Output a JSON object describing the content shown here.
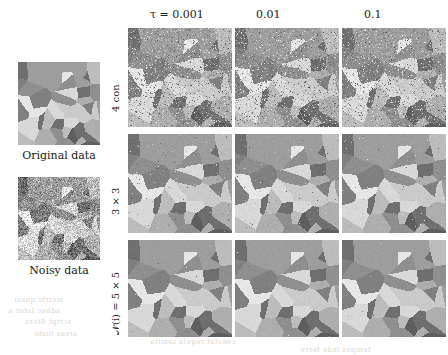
{
  "figure": {
    "type": "image-grid"
  },
  "columns": [
    {
      "id": "tau-0.001",
      "label": "τ = 0.001",
      "tau": 0.001
    },
    {
      "id": "tau-0.01",
      "label": "0.01",
      "tau": 0.01
    },
    {
      "id": "tau-0.1",
      "label": "0.1",
      "tau": 0.1
    }
  ],
  "rows": [
    {
      "id": "row-4con",
      "label": "4 con",
      "neighborhood": "4-connectivity"
    },
    {
      "id": "row-3x3",
      "label": "3 × 3",
      "neighborhood": "3x3"
    },
    {
      "id": "row-5x5",
      "label": "𝒩(i) = 5 × 5",
      "neighborhood": "5x5"
    }
  ],
  "reference_panels": [
    {
      "id": "original-data",
      "caption": "Original data"
    },
    {
      "id": "noisy-data",
      "caption": "Noisy data"
    }
  ],
  "palette": {
    "levels": [
      "#5e5e5e",
      "#6f6f6f",
      "#808080",
      "#8f8f8f",
      "#9d9d9d",
      "#aeaeae",
      "#bcbcbc",
      "#cacaca",
      "#d8d8d8",
      "#e6e6e6"
    ],
    "background": "#ffffff",
    "text": "#1a1a1a"
  },
  "noise": {
    "original_sigma": 0,
    "noisy_sigma": 46,
    "row_residual_noise": [
      34,
      8,
      2
    ]
  },
  "bleed_text": [
    {
      "text": "metric quasi",
      "x": 14,
      "y": 296
    },
    {
      "text": "adhuc  lator a",
      "x": 8,
      "y": 307
    },
    {
      "text": "script  Stern",
      "x": 24,
      "y": 318
    },
    {
      "text": "areas  iuste",
      "x": 34,
      "y": 330
    },
    {
      "text": "constat  regula  semita",
      "x": 150,
      "y": 338
    },
    {
      "text": "tempus  inde  ferre",
      "x": 300,
      "y": 346
    }
  ]
}
